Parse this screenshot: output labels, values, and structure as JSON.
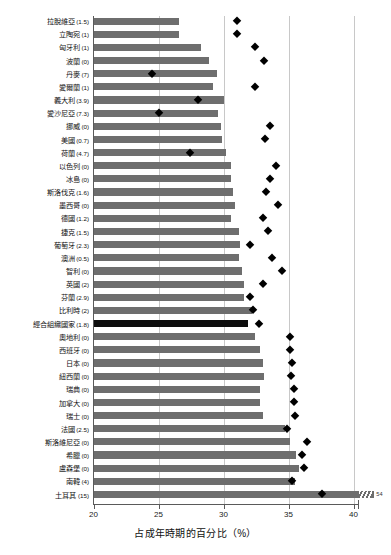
{
  "chart_data": {
    "type": "bar",
    "title": "",
    "xlabel": "占成年時期的百分比（%）",
    "ylabel": "",
    "xlim": [
      20,
      42
    ],
    "xticks": [
      20,
      25,
      30,
      35,
      40
    ],
    "xtick_labels": [
      "20",
      "25",
      "30",
      "35",
      "40"
    ],
    "grid": true,
    "legend": "none",
    "axis_break": {
      "present": true,
      "bar_category": "土耳其",
      "true_value": 54,
      "label": "54"
    },
    "series": [
      {
        "name": "bar",
        "marker": "bar",
        "color": "#6e6e6e"
      },
      {
        "name": "diamond",
        "marker": "diamond",
        "color": "#000000"
      }
    ],
    "highlight_category": "經合組織國家",
    "highlight_color": "#0d0d0d",
    "categories": [
      {
        "label": "拉脫維亞",
        "paren": "(1.5)",
        "bar": 26.6,
        "diamond": 31.0
      },
      {
        "label": "立陶宛",
        "paren": "(1)",
        "bar": 26.6,
        "diamond": 31.0
      },
      {
        "label": "匈牙利",
        "paren": "(1)",
        "bar": 28.3,
        "diamond": 32.4
      },
      {
        "label": "波蘭",
        "paren": "(0)",
        "bar": 28.9,
        "diamond": 33.1
      },
      {
        "label": "丹麥",
        "paren": "(7)",
        "bar": 29.5,
        "diamond": 24.5
      },
      {
        "label": "愛爾蘭",
        "paren": "(1)",
        "bar": 29.2,
        "diamond": 32.4
      },
      {
        "label": "義大利",
        "paren": "(3.9)",
        "bar": 30.0,
        "diamond": 28.0
      },
      {
        "label": "愛沙尼亞",
        "paren": "(7.3)",
        "bar": 29.6,
        "diamond": 25.0
      },
      {
        "label": "挪威",
        "paren": "(0)",
        "bar": 29.8,
        "diamond": 33.6
      },
      {
        "label": "美國",
        "paren": "(0.7)",
        "bar": 29.9,
        "diamond": 33.2
      },
      {
        "label": "荷蘭",
        "paren": "(4.7)",
        "bar": 30.2,
        "diamond": 27.4
      },
      {
        "label": "以色列",
        "paren": "(0)",
        "bar": 30.6,
        "diamond": 34.0
      },
      {
        "label": "冰島",
        "paren": "(0)",
        "bar": 30.6,
        "diamond": 33.6
      },
      {
        "label": "斯洛伐克",
        "paren": "(1.6)",
        "bar": 30.7,
        "diamond": 33.3
      },
      {
        "label": "墨西哥",
        "paren": "(0)",
        "bar": 30.9,
        "diamond": 34.2
      },
      {
        "label": "德國",
        "paren": "(1.2)",
        "bar": 30.6,
        "diamond": 33.0
      },
      {
        "label": "捷克",
        "paren": "(1.5)",
        "bar": 31.2,
        "diamond": 33.4
      },
      {
        "label": "葡萄牙",
        "paren": "(2.3)",
        "bar": 31.3,
        "diamond": 32.0
      },
      {
        "label": "澳洲",
        "paren": "(0.5)",
        "bar": 31.2,
        "diamond": 33.7
      },
      {
        "label": "智利",
        "paren": "(0)",
        "bar": 31.4,
        "diamond": 34.5
      },
      {
        "label": "英國",
        "paren": "(2)",
        "bar": 31.6,
        "diamond": 33.0
      },
      {
        "label": "芬蘭",
        "paren": "(2.9)",
        "bar": 31.6,
        "diamond": 32.0
      },
      {
        "label": "比利時",
        "paren": "(2)",
        "bar": 32.2,
        "diamond": 32.3
      },
      {
        "label": "經合組織國家",
        "paren": "(1.8)",
        "bar": 31.9,
        "diamond": 32.7
      },
      {
        "label": "奧地利",
        "paren": "(0)",
        "bar": 32.4,
        "diamond": 35.1
      },
      {
        "label": "西班牙",
        "paren": "(0)",
        "bar": 32.8,
        "diamond": 35.1
      },
      {
        "label": "日本",
        "paren": "(0)",
        "bar": 33.0,
        "diamond": 35.3
      },
      {
        "label": "紐西蘭",
        "paren": "(0)",
        "bar": 33.1,
        "diamond": 35.2
      },
      {
        "label": "瑞典",
        "paren": "(0)",
        "bar": 32.8,
        "diamond": 35.4
      },
      {
        "label": "加拿大",
        "paren": "(0)",
        "bar": 32.8,
        "diamond": 35.4
      },
      {
        "label": "瑞士",
        "paren": "(0)",
        "bar": 33.0,
        "diamond": 35.5
      },
      {
        "label": "法國",
        "paren": "(2.5)",
        "bar": 34.7,
        "diamond": 34.9
      },
      {
        "label": "斯洛維尼亞",
        "paren": "(0)",
        "bar": 35.1,
        "diamond": 36.4
      },
      {
        "label": "希臘",
        "paren": "(0)",
        "bar": 35.6,
        "diamond": 36.0
      },
      {
        "label": "盧森堡",
        "paren": "(0)",
        "bar": 35.8,
        "diamond": 36.2
      },
      {
        "label": "南韓",
        "paren": "(4)",
        "bar": 35.5,
        "diamond": 35.3
      },
      {
        "label": "土耳其",
        "paren": "(15)",
        "bar": 41.6,
        "diamond": 37.6
      }
    ]
  }
}
